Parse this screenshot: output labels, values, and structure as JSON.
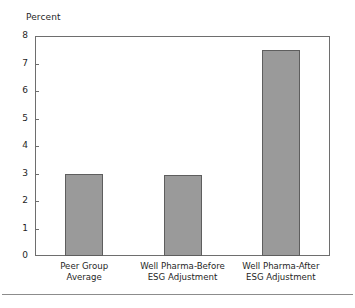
{
  "chart_data": {
    "type": "bar",
    "title": "",
    "subtitle": "",
    "unit_label": "Percent",
    "xlabel": "",
    "ylabel": "Percent",
    "categories": [
      "Peer Group Average",
      "Well Pharma-Before ESG Adjustment",
      "Well Pharma-After ESG Adjustment"
    ],
    "category_lines": [
      [
        "Peer Group",
        "Average"
      ],
      [
        "Well Pharma-Before",
        "ESG Adjustment"
      ],
      [
        "Well Pharma-After",
        "ESG Adjustment"
      ]
    ],
    "values": [
      3.0,
      2.95,
      7.5
    ],
    "ylim": [
      0,
      8
    ],
    "yticks": [
      0,
      1,
      2,
      3,
      4,
      5,
      6,
      7,
      8
    ],
    "ytick_labels": [
      "0",
      "1",
      "2",
      "3",
      "4",
      "5",
      "6",
      "7",
      "8"
    ],
    "grid": false,
    "legend": "none",
    "bar_color": "#9a9a9a",
    "bar_edge_color": "#5e5e5e",
    "axis_color": "#6e6e6e",
    "background_color": "#ffffff",
    "text_color": "#1f1f1f"
  }
}
